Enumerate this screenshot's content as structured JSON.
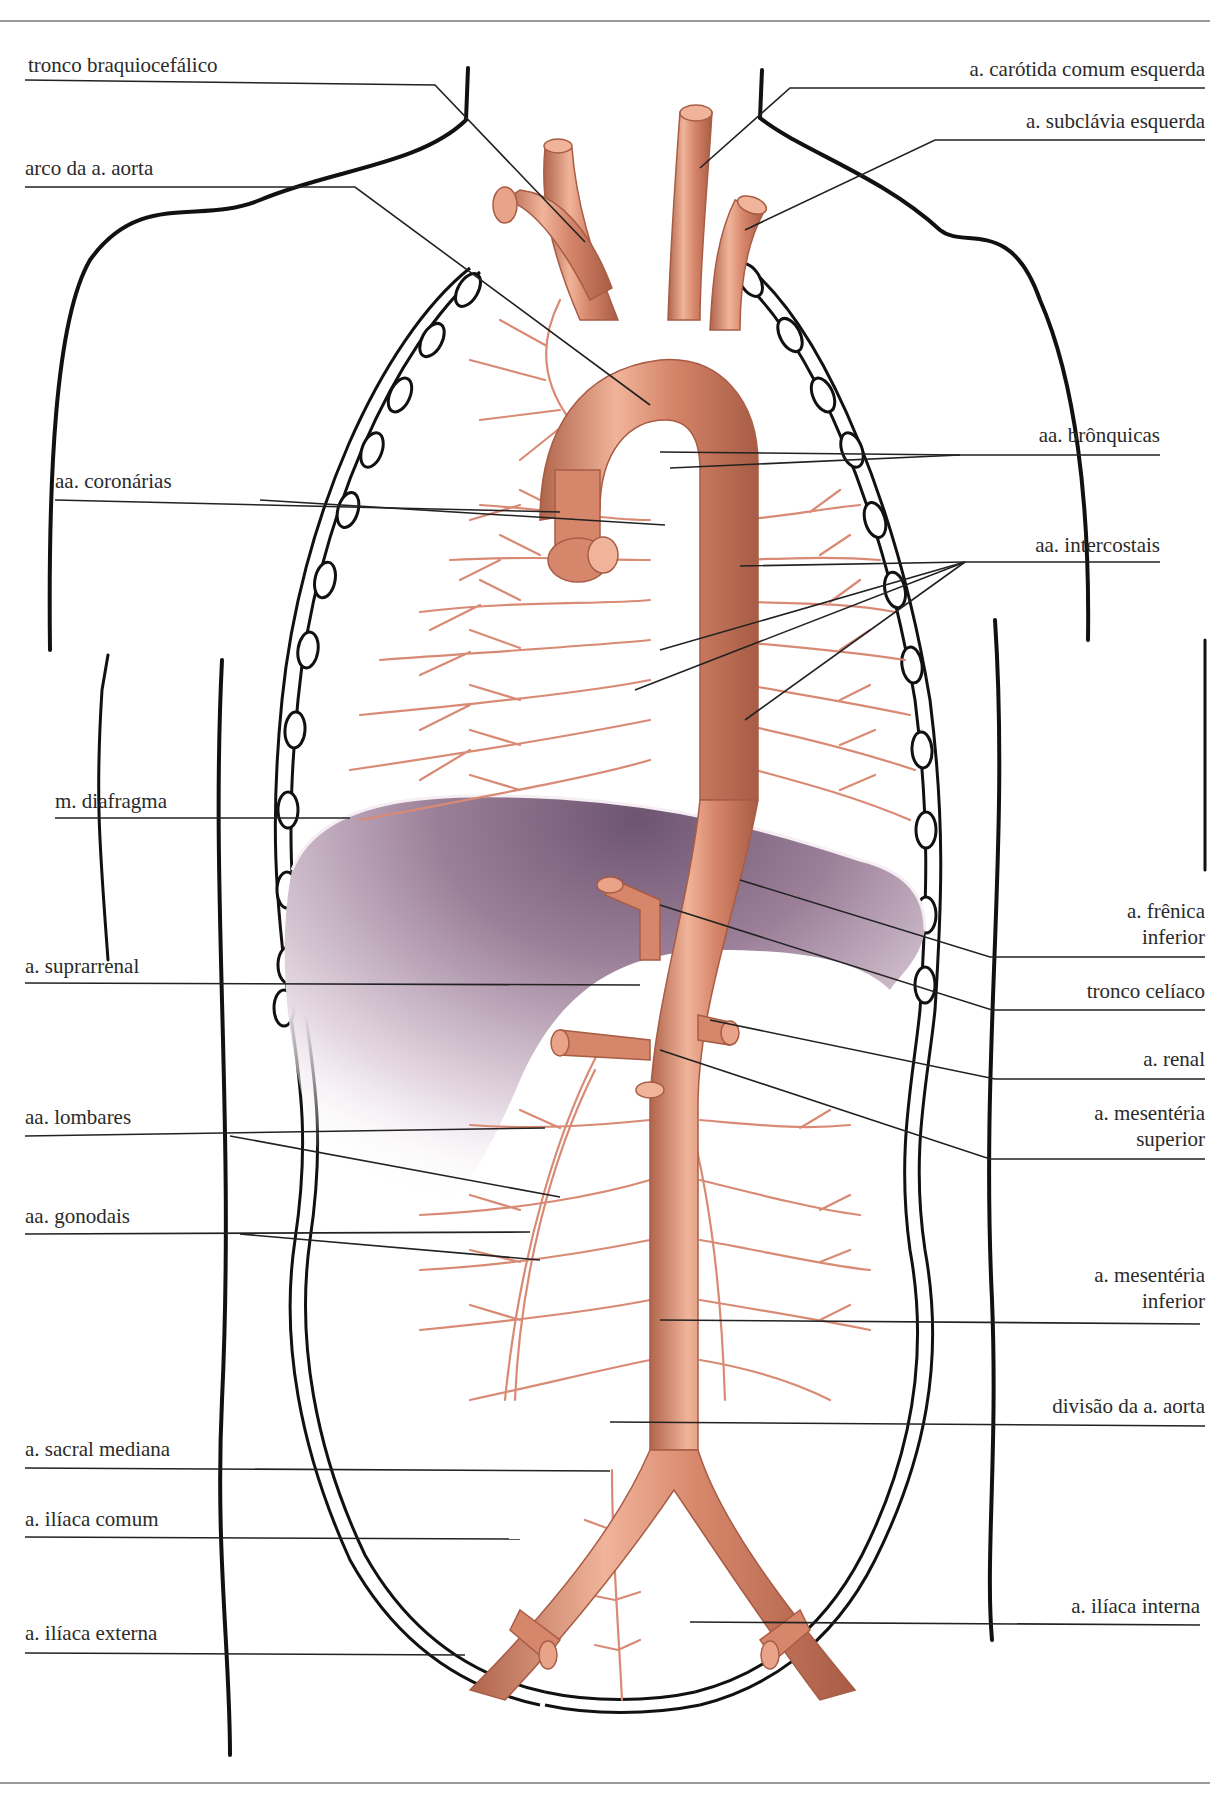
{
  "diagram": {
    "colors": {
      "artery": "#d6866a",
      "artery_shadow": "#b0654c",
      "artery_highlight": "#f3c3ae",
      "branch": "#d98a74",
      "diaphragm": "#8e6f87",
      "diaphragm_light": "#e9dde6",
      "outline": "#111111",
      "leader_line": "#222222"
    },
    "labels_left": [
      {
        "id": "tronco-braquiocefalico",
        "text": "tronco braquiocefálico"
      },
      {
        "id": "arco-aorta",
        "text": "arco da a. aorta"
      },
      {
        "id": "aa-coronarias",
        "text": "aa. coronárias"
      },
      {
        "id": "m-diafragma",
        "text": "m. diafragma"
      },
      {
        "id": "a-suprarrenal",
        "text": "a. suprarrenal"
      },
      {
        "id": "aa-lombares",
        "text": "aa. lombares"
      },
      {
        "id": "aa-gonodais",
        "text": "aa. gonodais"
      },
      {
        "id": "a-sacral-mediana",
        "text": "a. sacral mediana"
      },
      {
        "id": "a-iliaca-comum",
        "text": "a. ilíaca comum"
      },
      {
        "id": "a-iliaca-externa",
        "text": "a. ilíaca externa"
      }
    ],
    "labels_right": [
      {
        "id": "a-carotida-comum-esquerda",
        "text": "a. carótida comum esquerda"
      },
      {
        "id": "a-subclavia-esquerda",
        "text": "a. subclávia esquerda"
      },
      {
        "id": "aa-bronquicas",
        "text": "aa. brônquicas"
      },
      {
        "id": "aa-intercostais",
        "text": "aa. intercostais"
      },
      {
        "id": "a-frenica-inferior",
        "line1": "a. frênica",
        "line2": "inferior"
      },
      {
        "id": "tronco-celiaco",
        "text": "tronco celíaco"
      },
      {
        "id": "a-renal",
        "text": "a. renal"
      },
      {
        "id": "a-mesenteria-superior",
        "line1": "a. mesentéria",
        "line2": "superior"
      },
      {
        "id": "a-mesenteria-inferior",
        "line1": "a. mesentéria",
        "line2": "inferior"
      },
      {
        "id": "divisao-aorta",
        "text": "divisão da a. aorta"
      },
      {
        "id": "a-iliaca-interna",
        "text": "a. ilíaca interna"
      }
    ]
  }
}
